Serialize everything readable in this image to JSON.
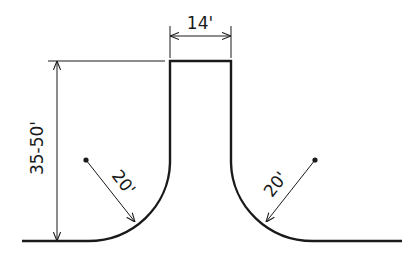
{
  "diagram": {
    "type": "technical-drawing",
    "colors": {
      "line": "#1a1a1a",
      "background": "#ffffff"
    },
    "dimensions": {
      "top_width": {
        "label": "14'"
      },
      "height": {
        "label": "35-50'"
      },
      "left_radius": {
        "label": "20'"
      },
      "right_radius": {
        "label": "20'"
      }
    }
  }
}
